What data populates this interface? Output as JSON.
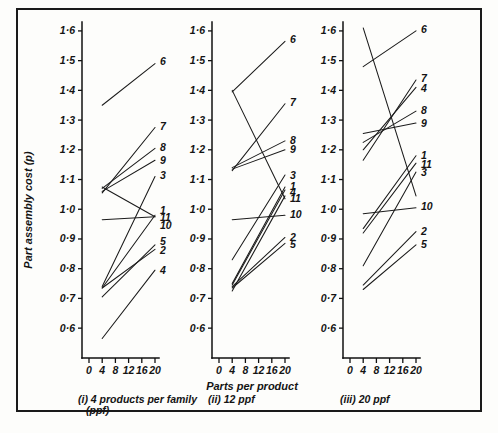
{
  "figure": {
    "ylabel": "Part assembly cost (p)",
    "xlabel": "Parts per product"
  },
  "chart_data": {
    "type": "line",
    "title": "",
    "xlabel": "Parts per product",
    "ylabel": "Part assembly cost (p)",
    "xlim": [
      0,
      22
    ],
    "ylim": [
      0.55,
      1.63
    ],
    "grid": false,
    "legend": "inline-end-labels",
    "x_ticks": [
      0,
      4,
      8,
      12,
      16,
      20
    ],
    "x_tick_labels": [
      "0",
      "4",
      "8",
      "12",
      "16",
      "20"
    ],
    "y_ticks": [
      0.6,
      0.7,
      0.8,
      0.9,
      1.0,
      1.1,
      1.2,
      1.3,
      1.4,
      1.5,
      1.6
    ],
    "y_tick_labels": [
      "0·6",
      "0·7",
      "0·8",
      "0·9",
      "1·0",
      "1·1",
      "1·2",
      "1·3",
      "1·4",
      "1·5",
      "1·6"
    ],
    "panels": [
      {
        "id": "panel-i",
        "caption_line1": "(i) 4 products per family",
        "caption_line2": "(ppf)",
        "series": [
          {
            "name": "1",
            "x": [
              4,
              20
            ],
            "y": [
              1.075,
              0.975
            ]
          },
          {
            "name": "2",
            "x": [
              4,
              20
            ],
            "y": [
              0.735,
              0.865
            ]
          },
          {
            "name": "3",
            "x": [
              4,
              20
            ],
            "y": [
              0.74,
              1.11
            ]
          },
          {
            "name": "4",
            "x": [
              4,
              20
            ],
            "y": [
              0.565,
              0.795
            ]
          },
          {
            "name": "5",
            "x": [
              4,
              20
            ],
            "y": [
              0.705,
              0.88
            ]
          },
          {
            "name": "6",
            "x": [
              4,
              20
            ],
            "y": [
              1.35,
              1.49
            ]
          },
          {
            "name": "7",
            "x": [
              4,
              20
            ],
            "y": [
              1.055,
              1.275
            ]
          },
          {
            "name": "8",
            "x": [
              4,
              20
            ],
            "y": [
              1.07,
              1.205
            ]
          },
          {
            "name": "9",
            "x": [
              4,
              20
            ],
            "y": [
              1.06,
              1.165
            ]
          },
          {
            "name": "10",
            "x": [
              4,
              20
            ],
            "y": [
              0.965,
              0.975
            ]
          },
          {
            "name": "11",
            "x": [
              4,
              20
            ],
            "y": [
              0.735,
              0.98
            ]
          }
        ],
        "labels": [
          {
            "name": "1",
            "value": 0.995
          },
          {
            "name": "2",
            "value": 0.862
          },
          {
            "name": "3",
            "value": 1.112
          },
          {
            "name": "4",
            "value": 0.793
          },
          {
            "name": "5",
            "value": 0.89
          },
          {
            "name": "6",
            "value": 1.497
          },
          {
            "name": "7",
            "value": 1.277
          },
          {
            "name": "8",
            "value": 1.207
          },
          {
            "name": "9",
            "value": 1.163
          },
          {
            "name": "10",
            "value": 0.945
          },
          {
            "name": "11",
            "value": 0.972
          }
        ]
      },
      {
        "id": "panel-ii",
        "caption_line1": "(ii) 12 ppf",
        "caption_line2": "",
        "series": [
          {
            "name": "1",
            "x": [
              4,
              20
            ],
            "y": [
              0.75,
              1.075
            ]
          },
          {
            "name": "2",
            "x": [
              4,
              20
            ],
            "y": [
              0.74,
              0.905
            ]
          },
          {
            "name": "3",
            "x": [
              4,
              20
            ],
            "y": [
              0.83,
              1.115
            ]
          },
          {
            "name": "4",
            "x": [
              4,
              20
            ],
            "y": [
              0.745,
              1.065
            ]
          },
          {
            "name": "5",
            "x": [
              4,
              20
            ],
            "y": [
              0.735,
              0.885
            ]
          },
          {
            "name": "6",
            "x": [
              4,
              20
            ],
            "y": [
              1.395,
              1.565
            ]
          },
          {
            "name": "7",
            "x": [
              4,
              20
            ],
            "y": [
              1.13,
              1.355
            ]
          },
          {
            "name": "8",
            "x": [
              4,
              20
            ],
            "y": [
              1.14,
              1.23
            ]
          },
          {
            "name": "9",
            "x": [
              4,
              20
            ],
            "y": [
              1.135,
              1.2
            ]
          },
          {
            "name": "10",
            "x": [
              4,
              20
            ],
            "y": [
              0.965,
              0.98
            ]
          },
          {
            "name": "11",
            "x": [
              4,
              20
            ],
            "y": [
              0.725,
              1.045
            ]
          },
          {
            "name": "12",
            "x": [
              4,
              20
            ],
            "y": [
              1.4,
              1.035
            ]
          }
        ],
        "labels": [
          {
            "name": "3",
            "value": 1.113
          },
          {
            "name": "1",
            "value": 1.078
          },
          {
            "name": "4",
            "value": 1.058
          },
          {
            "name": "11",
            "value": 1.035
          },
          {
            "name": "10",
            "value": 0.982
          },
          {
            "name": "2",
            "value": 0.905
          },
          {
            "name": "5",
            "value": 0.882
          },
          {
            "name": "6",
            "value": 1.57
          },
          {
            "name": "7",
            "value": 1.358
          },
          {
            "name": "8",
            "value": 1.232
          },
          {
            "name": "9",
            "value": 1.2
          }
        ]
      },
      {
        "id": "panel-iii",
        "caption_line1": "(iii) 20 ppf",
        "caption_line2": "",
        "series": [
          {
            "name": "1",
            "x": [
              4,
              20
            ],
            "y": [
              0.935,
              1.18
            ]
          },
          {
            "name": "2",
            "x": [
              4,
              20
            ],
            "y": [
              0.745,
              0.925
            ]
          },
          {
            "name": "3",
            "x": [
              4,
              20
            ],
            "y": [
              0.81,
              1.125
            ]
          },
          {
            "name": "4",
            "x": [
              4,
              20
            ],
            "y": [
              1.2,
              1.41
            ]
          },
          {
            "name": "5",
            "x": [
              4,
              20
            ],
            "y": [
              0.73,
              0.88
            ]
          },
          {
            "name": "6",
            "x": [
              4,
              20
            ],
            "y": [
              1.48,
              1.6
            ]
          },
          {
            "name": "7",
            "x": [
              4,
              20
            ],
            "y": [
              1.165,
              1.435
            ]
          },
          {
            "name": "8",
            "x": [
              4,
              20
            ],
            "y": [
              1.225,
              1.33
            ]
          },
          {
            "name": "9",
            "x": [
              4,
              20
            ],
            "y": [
              1.255,
              1.29
            ]
          },
          {
            "name": "10",
            "x": [
              4,
              20
            ],
            "y": [
              0.985,
              1.005
            ]
          },
          {
            "name": "11",
            "x": [
              4,
              20
            ],
            "y": [
              0.92,
              1.155
            ]
          },
          {
            "name": "12",
            "x": [
              4,
              20
            ],
            "y": [
              1.61,
              1.045
            ]
          }
        ],
        "labels": [
          {
            "name": "6",
            "value": 1.605
          },
          {
            "name": "7",
            "value": 1.44
          },
          {
            "name": "4",
            "value": 1.405
          },
          {
            "name": "8",
            "value": 1.332
          },
          {
            "name": "9",
            "value": 1.288
          },
          {
            "name": "1",
            "value": 1.182
          },
          {
            "name": "11",
            "value": 1.152
          },
          {
            "name": "3",
            "value": 1.122
          },
          {
            "name": "10",
            "value": 1.008
          },
          {
            "name": "2",
            "value": 0.925
          },
          {
            "name": "5",
            "value": 0.88
          }
        ]
      }
    ]
  }
}
